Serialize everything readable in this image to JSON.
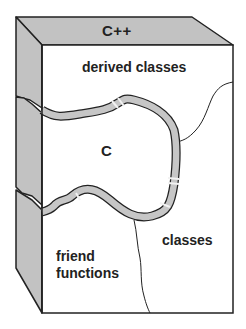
{
  "diagram": {
    "type": "3d-block-cutaway",
    "top_face_label": "C++",
    "regions": {
      "derived_classes": "derived classes",
      "c_core": "C",
      "classes": "classes",
      "friend_functions": "friend functions"
    },
    "colors": {
      "face_gray": "#c2c2c2",
      "front_face": "#ffffff",
      "outline": "#222222",
      "ring_band": "#c6c6c6",
      "ring_highlight": "#f2f2f2"
    }
  }
}
